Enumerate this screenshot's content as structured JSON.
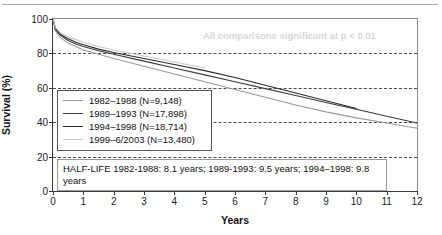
{
  "chart_data": {
    "type": "line",
    "title": "",
    "xlabel": "Years",
    "ylabel": "Survival (%)",
    "xlim": [
      0,
      12
    ],
    "ylim": [
      0,
      100
    ],
    "xticks": [
      "0",
      "1",
      "2",
      "3",
      "4",
      "5",
      "6",
      "7",
      "8",
      "9",
      "10",
      "11",
      "12"
    ],
    "yticks": [
      "0",
      "20",
      "40",
      "60",
      "80",
      "100"
    ],
    "grid": "horizontal-dashed",
    "legend_position": "left-middle",
    "annotations": [
      "All comparisons significant at p < 0.01",
      "HALF-LIFE 1982-1988: 8.1 years; 1989-1993: 9.5 years; 1994–1998: 9.8 years"
    ],
    "series": [
      {
        "name": "1982–1988 (N=9,148)",
        "color": "#9a9a9a",
        "x": [
          0,
          0.08,
          0.25,
          0.5,
          0.75,
          1,
          1.5,
          2,
          3,
          4,
          5,
          6,
          7,
          8,
          9,
          10,
          11,
          12
        ],
        "values": [
          100,
          93,
          89,
          86,
          84,
          82,
          79.5,
          77,
          72.5,
          68,
          63.5,
          59,
          54.5,
          50,
          46,
          42.5,
          39.5,
          36.5
        ]
      },
      {
        "name": "1989–1993 (N=17,898)",
        "color": "#3c3c3c",
        "x": [
          0,
          0.08,
          0.25,
          0.5,
          0.75,
          1,
          1.5,
          2,
          3,
          4,
          5,
          6,
          7,
          8,
          9,
          10,
          11,
          12
        ],
        "values": [
          100,
          94,
          90.5,
          87.5,
          85.5,
          84,
          81.5,
          79.5,
          75.5,
          71.5,
          67.5,
          63.5,
          59.5,
          55.5,
          51.5,
          47.5,
          43.5,
          39.5
        ]
      },
      {
        "name": "1994–1998 (N=18,714)",
        "color": "#2b2b2b",
        "x": [
          0,
          0.08,
          0.25,
          0.5,
          0.75,
          1,
          1.5,
          2,
          3,
          4,
          5,
          6,
          7,
          8,
          9,
          10
        ],
        "values": [
          100,
          94.5,
          91,
          88.5,
          86.5,
          85,
          82.5,
          80.5,
          77,
          73.5,
          70,
          66,
          61.5,
          57,
          52.5,
          48
        ]
      },
      {
        "name": "1999–6/2003 (N=13,480)",
        "color": "#c8c8c8",
        "x": [
          0,
          0.08,
          0.25,
          0.5,
          0.75,
          1,
          1.5,
          2,
          3,
          4,
          5
        ],
        "values": [
          100,
          95,
          92,
          89.5,
          88,
          86.5,
          84,
          82,
          78.5,
          75,
          71.5
        ]
      }
    ]
  },
  "axes": {
    "ylabel": "Survival (%)",
    "xlabel": "Years",
    "yticks": [
      "100",
      "80",
      "60",
      "40",
      "20",
      "0"
    ],
    "xticks": [
      "0",
      "1",
      "2",
      "3",
      "4",
      "5",
      "6",
      "7",
      "8",
      "9",
      "10",
      "11",
      "12"
    ]
  },
  "legend": {
    "items": [
      {
        "label": "1982–1988 (N=9,148)"
      },
      {
        "label": "1989–1993 (N=17,898)"
      },
      {
        "label": "1994–1998 (N=18,714)"
      },
      {
        "label": "1999–6/2003 (N=13,480)"
      }
    ]
  },
  "notes": {
    "significance": "All comparisons significant at p < 0.01",
    "halflife": "HALF-LIFE 1982-1988: 8.1 years; 1989-1993: 9.5 years; 1994–1998: 9.8 years"
  }
}
